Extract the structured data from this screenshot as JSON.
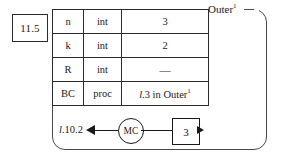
{
  "figure": {
    "step_number": "11.5",
    "frame": {
      "label": "Outer",
      "label_superscript": "1"
    },
    "symbol_table": {
      "columns": [
        "name",
        "type",
        "value"
      ],
      "rows": [
        {
          "name": "n",
          "type": "int",
          "value": "3"
        },
        {
          "name": "k",
          "type": "int",
          "value": "2"
        },
        {
          "name": "R",
          "type": "int",
          "value": "—"
        },
        {
          "name": "BC",
          "type": "proc",
          "value_italic": "l",
          "value_rest": ".3 in Outer",
          "value_sup": "1"
        }
      ]
    },
    "control": {
      "return_label_italic": "l",
      "return_label_rest": ".10.2",
      "machine_node": "MC",
      "result_value": "3"
    }
  }
}
